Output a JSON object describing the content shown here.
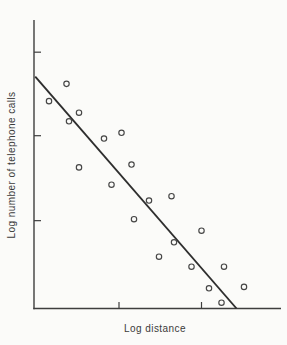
{
  "figure": {
    "ink_color": "#3e3e3e",
    "fit_line_color": "#2e2e2e",
    "paper_color": "#fbfbf9"
  },
  "chart_data": {
    "type": "scatter",
    "title": "",
    "xlabel": "Log distance",
    "ylabel": "Log number of telephone calls",
    "units": "relative 0-10 scale (axes carry tick marks but no numeric labels in the image)",
    "xlim": [
      0,
      10
    ],
    "ylim": [
      0,
      10
    ],
    "grid": false,
    "legend": null,
    "x_ticks": [
      3.4,
      6.7
    ],
    "y_ticks": [
      3.05,
      6.0,
      8.9
    ],
    "points": [
      [
        0.6,
        7.2
      ],
      [
        1.3,
        7.8
      ],
      [
        1.4,
        6.5
      ],
      [
        1.8,
        6.8
      ],
      [
        2.8,
        5.9
      ],
      [
        3.5,
        6.1
      ],
      [
        1.8,
        4.9
      ],
      [
        3.9,
        5.0
      ],
      [
        3.1,
        4.3
      ],
      [
        4.0,
        3.1
      ],
      [
        4.6,
        3.75
      ],
      [
        5.5,
        3.9
      ],
      [
        6.7,
        2.7
      ],
      [
        5.6,
        2.3
      ],
      [
        5.0,
        1.8
      ],
      [
        6.3,
        1.45
      ],
      [
        7.6,
        1.45
      ],
      [
        7.0,
        0.7
      ],
      [
        8.4,
        0.75
      ],
      [
        7.5,
        0.2
      ]
    ],
    "fit_line": {
      "start": [
        0.05,
        8.05
      ],
      "end": [
        8.1,
        0.0
      ]
    }
  }
}
